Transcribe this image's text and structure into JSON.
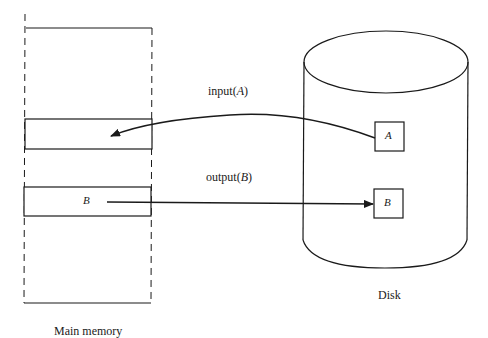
{
  "diagram": {
    "main_memory": {
      "label": "Main memory",
      "block_a_label": "",
      "block_b_label": "B"
    },
    "disk": {
      "label": "Disk",
      "block_a_label": "A",
      "block_b_label": "B"
    },
    "operations": {
      "input": {
        "name": "input",
        "open": "(",
        "arg": "A",
        "close": ")"
      },
      "output": {
        "name": "output",
        "open": "(",
        "arg": "B",
        "close": ")"
      }
    },
    "colors": {
      "stroke": "#1a1a1a",
      "background": "#ffffff"
    }
  }
}
